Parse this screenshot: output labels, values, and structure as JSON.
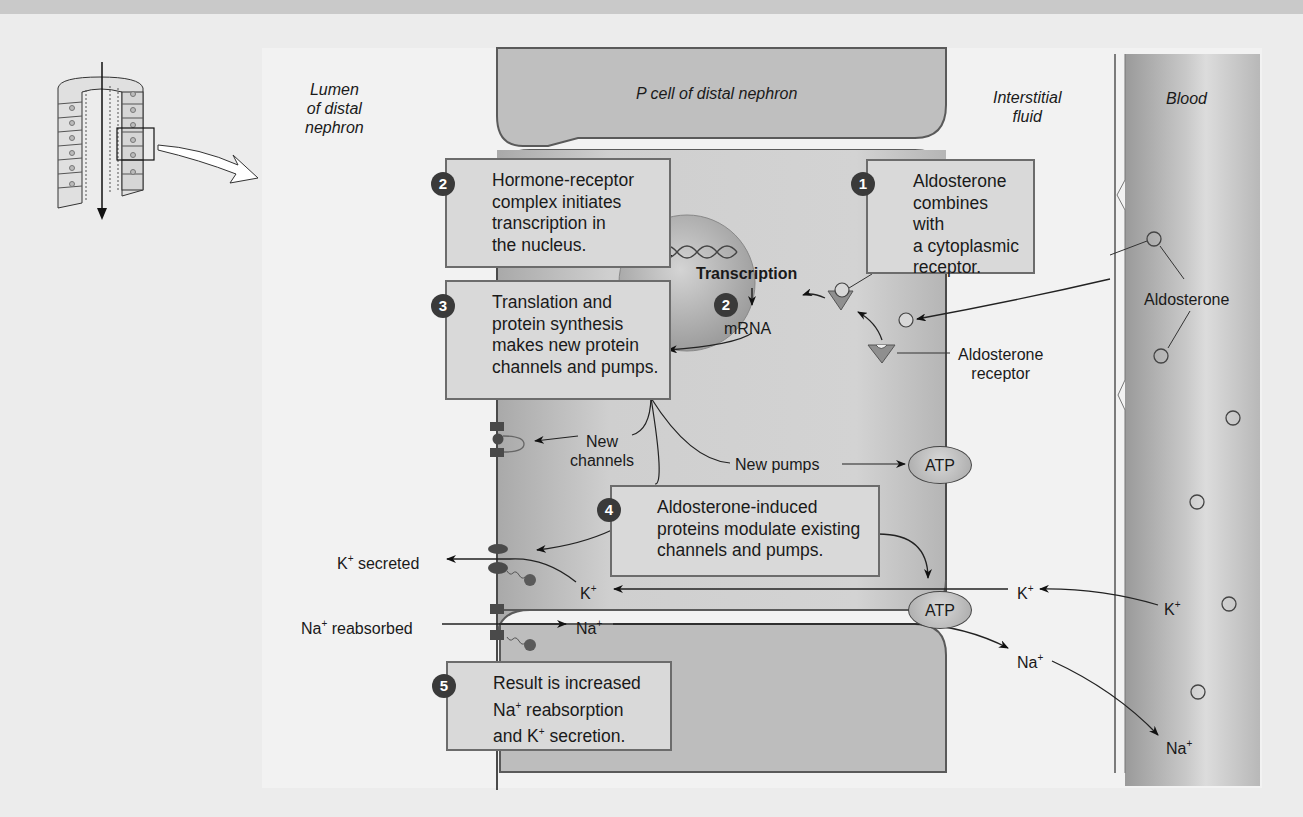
{
  "figure": {
    "regions": {
      "lumen": "Lumen\nof distal\nnephron",
      "cell": "P cell of distal nephron",
      "interstitial": "Interstitial\nfluid",
      "blood": "Blood"
    },
    "steps": [
      {
        "number": "1",
        "text": "Aldosterone combines with a cytoplasmic receptor."
      },
      {
        "number": "2",
        "text": "Hormone-receptor complex initiates transcription in the nucleus."
      },
      {
        "number": "3",
        "text": "Translation and protein synthesis makes new protein channels and pumps."
      },
      {
        "number": "4",
        "text": "Aldosterone-induced proteins modulate existing channels and pumps."
      },
      {
        "number": "5",
        "text": "Result is increased Na+ reabsorption and K+ secretion."
      }
    ],
    "step_lines": {
      "s1": [
        "Aldosterone",
        "combines with",
        "a cytoplasmic",
        "receptor."
      ],
      "s2": [
        "Hormone-receptor",
        "complex initiates",
        "transcription in",
        "the nucleus."
      ],
      "s3": [
        "Translation and",
        "protein synthesis",
        "makes new protein",
        "channels and pumps."
      ],
      "s4": [
        "Aldosterone-induced",
        "proteins modulate existing",
        "channels and pumps."
      ],
      "s5_line1": "Result is increased",
      "s5_line2_pre": "Na",
      "s5_line2_post": " reabsorption",
      "s5_line3_pre": "and K",
      "s5_line3_post": " secretion."
    },
    "nucleus": {
      "process": "Transcription",
      "step_number": "2",
      "product": "mRNA"
    },
    "labels": {
      "aldosterone_blood": "Aldosterone",
      "aldosterone_receptor": "Aldosterone\nreceptor",
      "new_channels": "New\nchannels",
      "new_pumps": "New pumps",
      "atp_top": "ATP",
      "atp_bottom": "ATP",
      "k_secreted": "K",
      "k_secreted_suffix": " secreted",
      "na_reabsorbed": "Na",
      "na_reabsorbed_suffix": " reabsorbed",
      "k_cell": "K",
      "na_cell": "Na",
      "k_interstitial": "K",
      "na_interstitial": "Na",
      "k_blood": "K",
      "na_blood": "Na",
      "plus": "+"
    },
    "colors": {
      "box_fill": "#d9d9d9",
      "box_border": "#6c6c6c",
      "step_badge": "#3a3a3a",
      "cell_fill": "#c4c4c4",
      "blood_fill": "#b5b5b5",
      "background": "#ececec"
    }
  }
}
